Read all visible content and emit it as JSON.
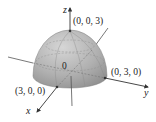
{
  "figure": {
    "type": "3d-hemisphere-diagram",
    "axes": {
      "x": "x",
      "y": "y",
      "z": "z"
    },
    "origin_label": "0",
    "points": [
      {
        "name": "top",
        "label": "(0, 0, 3)"
      },
      {
        "name": "x-intercept",
        "label": "(3, 0, 0)"
      },
      {
        "name": "y-intercept",
        "label": "(0, 3, 0)"
      }
    ],
    "colors": {
      "surface": "#a9a9a9",
      "surface_highlight": "#d4d4d4",
      "axis": "#444444",
      "grid": "#8a8a8a"
    }
  }
}
